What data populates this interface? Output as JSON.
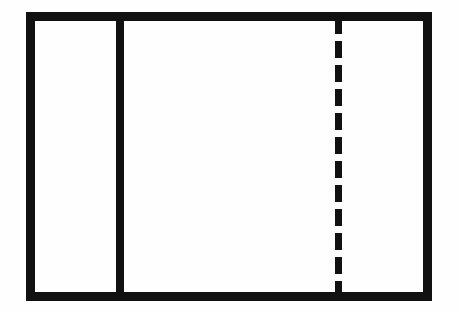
{
  "figure": {
    "type": "line-drawing",
    "canvas": {
      "width": 459,
      "height": 312,
      "background_color": "#fefefe"
    },
    "stroke_color": "#111111"
  },
  "shapes": {
    "outer_rectangle": {
      "name": "outer-rectangle",
      "shape": "rectangle",
      "stroke_style": "solid",
      "stroke_color": "#111111",
      "stroke_width_px": 9,
      "fill": "none",
      "left_px": 26,
      "top_px": 12,
      "width_px": 406,
      "height_px": 289,
      "right_px": 432,
      "bottom_px": 301
    },
    "solid_divider": {
      "name": "solid-vertical-divider",
      "shape": "line",
      "orientation": "vertical",
      "stroke_style": "solid",
      "stroke_color": "#111111",
      "stroke_width_px": 8,
      "x_px": 116,
      "top_px": 12,
      "bottom_px": 301,
      "length_px": 289
    },
    "dashed_centerline": {
      "name": "dashed-center-line",
      "shape": "line",
      "orientation": "vertical",
      "stroke_style": "dashed",
      "stroke_color": "#111111",
      "stroke_width_px": 7,
      "dash_length_px": 17,
      "gap_length_px": 7,
      "x_px": 335,
      "top_px": 17,
      "bottom_px": 297,
      "length_px": 280
    }
  },
  "regions": [
    {
      "name": "left-panel",
      "left_px": 35,
      "right_px": 116,
      "width_px": 81
    },
    {
      "name": "right-panel",
      "left_px": 124,
      "right_px": 423,
      "width_px": 299
    }
  ],
  "labels": {
    "count": 0,
    "text_items": []
  }
}
